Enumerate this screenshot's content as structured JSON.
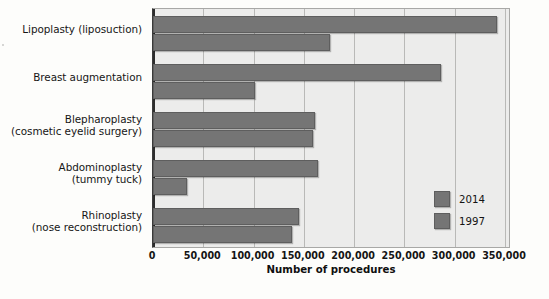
{
  "chart_data": {
    "type": "bar",
    "orientation": "horizontal",
    "title": "",
    "xlabel": "Number of procedures",
    "ylabel": "",
    "xlim": [
      0,
      350000
    ],
    "xticks": [
      0,
      50000,
      100000,
      150000,
      200000,
      250000,
      300000,
      350000
    ],
    "xtick_labels": [
      "0",
      "50,000",
      "100,000",
      "150,000",
      "200,000",
      "250,000",
      "300,000",
      "350,000"
    ],
    "grid": true,
    "grid_axis": "x",
    "legend_position": "inside-right",
    "categories": [
      "Lipoplasty (liposuction)",
      "Breast augmentation",
      "Blepharoplasty (cosmetic eyelid surgery)",
      "Abdominoplasty (tummy tuck)",
      "Rhinoplasty (nose reconstruction)"
    ],
    "category_lines": [
      [
        "Lipoplasty (liposuction)"
      ],
      [
        "Breast augmentation"
      ],
      [
        "Blepharoplasty",
        "(cosmetic eyelid surgery)"
      ],
      [
        "Abdominoplasty",
        "(tummy tuck)"
      ],
      [
        "Rhinoplasty",
        "(nose reconstruction)"
      ]
    ],
    "series": [
      {
        "name": "2014",
        "color": "#757575",
        "values": [
          342000,
          286000,
          161000,
          164000,
          145000
        ]
      },
      {
        "name": "1997",
        "color": "#757575",
        "values": [
          176000,
          101000,
          159000,
          34000,
          138000
        ]
      }
    ]
  },
  "legend": {
    "items": [
      {
        "label": "2014",
        "color": "#757575"
      },
      {
        "label": "1997",
        "color": "#757575"
      }
    ]
  },
  "axis": {
    "x_title": "Number of procedures"
  },
  "colors": {
    "bar_fill": "#757575",
    "bar_stroke": "#5e5e5e",
    "plot_background": "#ececeb",
    "gridline": "#b9b9b7",
    "axis_line": "#2d2d2d",
    "page_background": "#fdfdfb",
    "text": "#141414"
  }
}
